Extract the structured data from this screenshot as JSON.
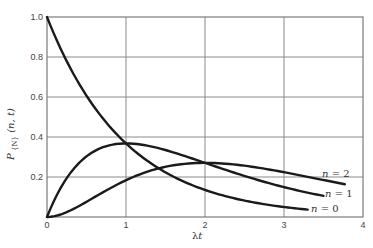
{
  "chart_data": {
    "type": "line",
    "title": "",
    "xlabel": "λt",
    "ylabel": "P",
    "ylabel_subscript": "{N}",
    "ylabel_args": "(n, t)",
    "xlim": [
      0,
      4
    ],
    "ylim": [
      0,
      1.0
    ],
    "x_ticks": [
      "0",
      "1",
      "2",
      "3",
      "4"
    ],
    "y_ticks": [
      "0.2",
      "0.4",
      "0.6",
      "0.8",
      "1.0"
    ],
    "y_origin_label": "0",
    "grid": true,
    "legend": "inline labels at curve ends",
    "series": [
      {
        "name": "n = 0",
        "formula": "exp(-λt)",
        "x_end": 3.3,
        "x": [
          0,
          0.5,
          1,
          1.5,
          2,
          2.5,
          3,
          3.3
        ],
        "values": [
          1.0,
          0.61,
          0.37,
          0.22,
          0.14,
          0.08,
          0.05,
          0.04
        ]
      },
      {
        "name": "n = 1",
        "formula": "λt·exp(-λt)",
        "x_end": 3.5,
        "x": [
          0,
          0.5,
          1,
          1.5,
          2,
          2.5,
          3,
          3.5
        ],
        "values": [
          0.0,
          0.3,
          0.37,
          0.33,
          0.27,
          0.21,
          0.15,
          0.11
        ]
      },
      {
        "name": "n = 2",
        "formula": "(λt)^2/2·exp(-λt)",
        "x_end": 3.77,
        "x": [
          0,
          0.5,
          1,
          1.5,
          2,
          2.5,
          3,
          3.5,
          3.77
        ],
        "values": [
          0.0,
          0.08,
          0.18,
          0.25,
          0.27,
          0.26,
          0.22,
          0.18,
          0.16
        ]
      }
    ]
  }
}
